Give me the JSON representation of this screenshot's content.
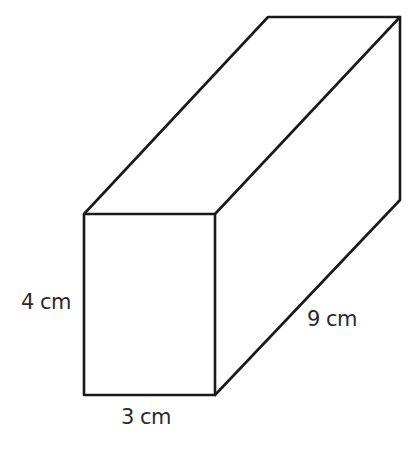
{
  "diagram": {
    "type": "cuboid",
    "stroke_color": "#1a1a1a",
    "background_color": "#ffffff",
    "labels": {
      "height": "4 cm",
      "width": "3 cm",
      "length": "9 cm"
    },
    "dimensions": {
      "height_cm": 4,
      "width_cm": 3,
      "length_cm": 9
    }
  }
}
